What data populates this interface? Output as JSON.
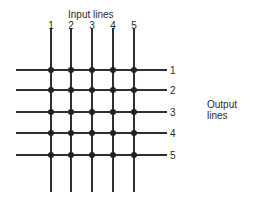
{
  "diagram": {
    "input_title": "Input lines",
    "output_title_line1": "Output",
    "output_title_line2": "lines",
    "input_lines": [
      {
        "label": "1",
        "x": 51
      },
      {
        "label": "2",
        "x": 71
      },
      {
        "label": "3",
        "x": 92
      },
      {
        "label": "4",
        "x": 113
      },
      {
        "label": "5",
        "x": 134
      }
    ],
    "output_lines": [
      {
        "label": "1",
        "y": 70
      },
      {
        "label": "2",
        "y": 90
      },
      {
        "label": "3",
        "y": 112
      },
      {
        "label": "4",
        "y": 133
      },
      {
        "label": "5",
        "y": 155
      }
    ],
    "line_color": "#2f2f2f",
    "crosspoint_color": "#222222"
  }
}
